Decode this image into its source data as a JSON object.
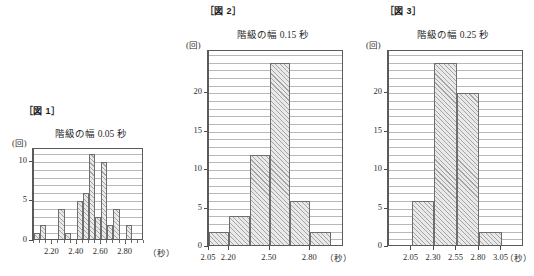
{
  "page": {
    "background": "#ffffff",
    "ink": "#2b2b2b",
    "bar_fill": "#e9e9e9",
    "bar_edge": "#6e6e6e",
    "grid": "#b8b8b8",
    "axis": "#5a5a5a"
  },
  "figures": [
    {
      "id": "fig1",
      "label": "［図 1］",
      "title": "階級の幅 0.05 秒",
      "y_unit": "(回)",
      "x_unit": "（秒）"
    },
    {
      "id": "fig2",
      "label": "［図 2］",
      "title": "階級の幅 0.15 秒",
      "y_unit": "(回)",
      "x_unit": "（秒）"
    },
    {
      "id": "fig3",
      "label": "［図 3］",
      "title": "階級の幅 0.25 秒",
      "y_unit": "(回)",
      "x_unit": "（秒）"
    }
  ],
  "chart_data": [
    {
      "type": "bar",
      "title": "階級の幅 0.05 秒",
      "figure_label": "［図 1］",
      "xlabel": "（秒）",
      "ylabel": "(回)",
      "grid": true,
      "legend": "none",
      "bin_width": 0.05,
      "x_start": 2.05,
      "x_end": 2.95,
      "xlim": [
        2.05,
        2.95
      ],
      "ylim": [
        0,
        11.6
      ],
      "yticks": [
        0,
        5,
        10
      ],
      "y_minor_step": 1,
      "xticks": [
        2.2,
        2.4,
        2.6,
        2.8
      ],
      "xtick_labels": [
        "2.20",
        "2.40",
        "2.60",
        "2.80"
      ],
      "bin_edges": [
        2.05,
        2.1,
        2.15,
        2.2,
        2.25,
        2.3,
        2.35,
        2.4,
        2.45,
        2.5,
        2.55,
        2.6,
        2.65,
        2.7,
        2.75,
        2.8,
        2.85,
        2.9,
        2.95
      ],
      "categories": [
        "2.05-2.10",
        "2.10-2.15",
        "2.15-2.20",
        "2.20-2.25",
        "2.25-2.30",
        "2.30-2.35",
        "2.35-2.40",
        "2.40-2.45",
        "2.45-2.50",
        "2.50-2.55",
        "2.55-2.60",
        "2.60-2.65",
        "2.65-2.70",
        "2.70-2.75",
        "2.75-2.80",
        "2.80-2.85",
        "2.85-2.90",
        "2.90-2.95"
      ],
      "values": [
        1,
        2,
        0,
        0,
        4,
        1,
        0,
        5,
        6,
        11,
        3,
        10,
        2,
        4,
        0,
        2,
        0,
        0
      ]
    },
    {
      "type": "bar",
      "title": "階級の幅 0.15 秒",
      "figure_label": "［図 2］",
      "xlabel": "（秒）",
      "ylabel": "(回)",
      "grid": true,
      "legend": "none",
      "bin_width": 0.15,
      "x_start": 2.05,
      "x_end": 3.05,
      "xlim": [
        2.05,
        3.05
      ],
      "ylim": [
        0,
        25.5
      ],
      "yticks": [
        0,
        5,
        10,
        15,
        20
      ],
      "y_minor_step": 1,
      "xticks": [
        2.05,
        2.2,
        2.5,
        2.8
      ],
      "xtick_labels": [
        "2.05",
        "2.20",
        "2.50",
        "2.80"
      ],
      "bin_edges": [
        2.05,
        2.2,
        2.35,
        2.5,
        2.65,
        2.8,
        2.95
      ],
      "categories": [
        "2.05-2.20",
        "2.20-2.35",
        "2.35-2.50",
        "2.50-2.65",
        "2.65-2.80",
        "2.80-2.95"
      ],
      "values": [
        2,
        4,
        12,
        24,
        6,
        2
      ]
    },
    {
      "type": "bar",
      "title": "階級の幅 0.25 秒",
      "figure_label": "［図 3］",
      "xlabel": "（秒）",
      "ylabel": "(回)",
      "grid": true,
      "legend": "none",
      "bin_width": 0.25,
      "x_start": 1.8,
      "x_end": 3.3,
      "xlim": [
        1.8,
        3.3
      ],
      "ylim": [
        0,
        25.5
      ],
      "yticks": [
        0,
        5,
        10,
        15,
        20
      ],
      "y_minor_step": 1,
      "xticks": [
        2.05,
        2.3,
        2.55,
        2.8,
        3.05
      ],
      "xtick_labels": [
        "2.05",
        "2.30",
        "2.55",
        "2.80",
        "3.05"
      ],
      "bin_edges": [
        2.05,
        2.3,
        2.55,
        2.8,
        3.05
      ],
      "categories": [
        "2.05-2.30",
        "2.30-2.55",
        "2.55-2.80",
        "2.80-3.05"
      ],
      "values": [
        6,
        24,
        20,
        2
      ]
    }
  ]
}
